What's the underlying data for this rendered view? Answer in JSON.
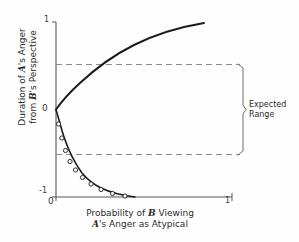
{
  "chart_data": {
    "type": "line",
    "title": "",
    "xlabel_line1": "Probability of B Viewing",
    "xlabel_line2": "A's Anger as Atypical",
    "ylabel_line1": "Duration of A's Anger",
    "ylabel_line2": "from B's Perspective",
    "xlim": [
      0,
      1
    ],
    "ylim": [
      -1,
      1
    ],
    "xticks": [
      "0",
      "1"
    ],
    "yticks": [
      "-1",
      "0",
      "1"
    ],
    "grid": false,
    "legend": "none",
    "series": [
      {
        "name": "upper-branch",
        "markers": false,
        "x": [
          0.0,
          0.02,
          0.05,
          0.09,
          0.14,
          0.2,
          0.27,
          0.35,
          0.44,
          0.54,
          0.65,
          0.76,
          0.84
        ],
        "y": [
          0.0,
          0.1,
          0.2,
          0.3,
          0.39,
          0.48,
          0.57,
          0.65,
          0.73,
          0.8,
          0.87,
          0.93,
          0.96
        ]
      },
      {
        "name": "lower-branch",
        "markers": true,
        "x": [
          0.0,
          0.015,
          0.035,
          0.06,
          0.09,
          0.13,
          0.18,
          0.24,
          0.31,
          0.385,
          0.45
        ],
        "y": [
          0.0,
          -0.17,
          -0.33,
          -0.47,
          -0.59,
          -0.69,
          -0.78,
          -0.86,
          -0.92,
          -0.97,
          -1.0
        ]
      }
    ],
    "reference_lines": [
      {
        "name": "expected-range-upper",
        "y": 0.52,
        "style": "dashed"
      },
      {
        "name": "expected-range-lower",
        "y": -0.52,
        "style": "dashed"
      }
    ],
    "annotations": [
      {
        "name": "expected-range",
        "text_line1": "Expected",
        "text_line2": "Range",
        "bracket_y_top": 0.52,
        "bracket_y_bottom": -0.52
      }
    ]
  }
}
